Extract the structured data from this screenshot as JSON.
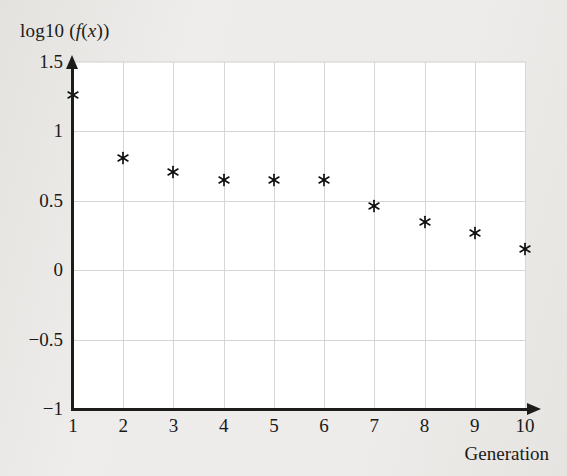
{
  "chart_data": {
    "type": "scatter",
    "title": "",
    "ylabel": "log10 (f(x))",
    "ylabel_parts": {
      "prefix": "log10 (",
      "func": "f",
      "open": "(",
      "var": "x",
      "close": "))"
    },
    "xlabel": "Generation",
    "x": [
      1,
      2,
      3,
      4,
      5,
      6,
      7,
      8,
      9,
      10
    ],
    "values": [
      1.26,
      0.81,
      0.71,
      0.65,
      0.65,
      0.65,
      0.46,
      0.35,
      0.27,
      0.15
    ],
    "series": [
      {
        "name": "log10 of best fitness",
        "values": [
          1.26,
          0.81,
          0.71,
          0.65,
          0.65,
          0.65,
          0.46,
          0.35,
          0.27,
          0.15
        ]
      }
    ],
    "xlim": [
      1,
      10
    ],
    "ylim": [
      -1,
      1.5
    ],
    "xticks": [
      "1",
      "2",
      "3",
      "4",
      "5",
      "6",
      "7",
      "8",
      "9",
      "10"
    ],
    "xtick_values": [
      1,
      2,
      3,
      4,
      5,
      6,
      7,
      8,
      9,
      10
    ],
    "yticks": [
      "1.5",
      "1",
      "0.5",
      "0",
      "−0.5",
      "−1"
    ],
    "ytick_values": [
      1.5,
      1.0,
      0.5,
      0.0,
      -0.5,
      -1.0
    ],
    "grid": true,
    "legend": null,
    "marker": "asterisk",
    "marker_color": "#111111",
    "grid_color": "#d8d6d4",
    "axis_color": "#1c1c1c",
    "plot_bg": "#ffffff",
    "page_bg": "#edecea"
  }
}
